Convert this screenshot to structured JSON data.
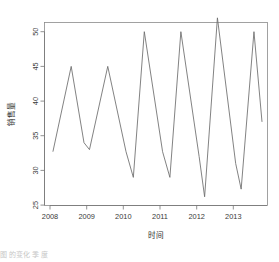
{
  "figure": {
    "background": "#ffffff",
    "line_color": "#6b6b6b",
    "axis_color": "#767676",
    "frame_color": "#8a8a8a"
  },
  "chart_data": {
    "type": "line",
    "title": "",
    "xlabel": "时间",
    "ylabel": "销售量",
    "xlim": [
      2007.92,
      2013.72
    ],
    "ylim": [
      24.2,
      53.2
    ],
    "xticks": [
      2008,
      2009,
      2010,
      2011,
      2012,
      2013
    ],
    "xtick_labels": [
      "2008",
      "2009",
      "2010",
      "2011",
      "2012",
      "2013"
    ],
    "yticks": [
      25,
      30,
      35,
      40,
      45,
      50
    ],
    "ytick_labels": [
      "25",
      "30",
      "35",
      "40",
      "45",
      "50"
    ],
    "grid": false,
    "legend": null,
    "frequency": "semiannual",
    "x": [
      2008.0,
      2008.5,
      2009.0,
      2009.25,
      2009.5,
      2010.0,
      2010.25,
      2010.5,
      2011.0,
      2011.25,
      2011.5,
      2012.0,
      2012.25,
      2012.5,
      2013.0,
      2013.25,
      2013.5,
      2013.72
    ],
    "series": [
      {
        "name": "销售量",
        "x": [
          2008.0,
          2008.5,
          2008.85,
          2009.0,
          2009.5,
          2010.0,
          2010.2,
          2010.5,
          2011.0,
          2011.2,
          2011.5,
          2012.0,
          2012.15,
          2012.5,
          2013.0,
          2013.15,
          2013.5,
          2013.72
        ],
        "values": [
          32.7,
          45.0,
          34.0,
          33.0,
          45.0,
          32.7,
          29.0,
          50.0,
          32.7,
          29.0,
          50.0,
          32.0,
          26.2,
          52.0,
          31.0,
          27.3,
          50.0,
          37.0
        ]
      }
    ],
    "points": [
      {
        "x": 2008.0,
        "y": 32.7
      },
      {
        "x": 2008.5,
        "y": 45.0
      },
      {
        "x": 2008.85,
        "y": 34.0
      },
      {
        "x": 2009.0,
        "y": 33.0
      },
      {
        "x": 2009.5,
        "y": 45.0
      },
      {
        "x": 2010.0,
        "y": 32.7
      },
      {
        "x": 2010.2,
        "y": 29.0
      },
      {
        "x": 2010.5,
        "y": 50.0
      },
      {
        "x": 2011.0,
        "y": 32.7
      },
      {
        "x": 2011.2,
        "y": 29.0
      },
      {
        "x": 2011.5,
        "y": 50.0
      },
      {
        "x": 2012.0,
        "y": 32.0
      },
      {
        "x": 2012.15,
        "y": 26.2
      },
      {
        "x": 2012.5,
        "y": 52.0
      },
      {
        "x": 2013.0,
        "y": 31.0
      },
      {
        "x": 2013.15,
        "y": 27.3
      },
      {
        "x": 2013.5,
        "y": 50.0
      },
      {
        "x": 2013.72,
        "y": 37.0
      }
    ]
  },
  "caption": {
    "text": "图                 的变化                                         季                度"
  }
}
